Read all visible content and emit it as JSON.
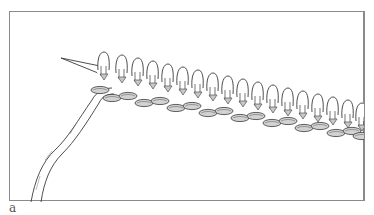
{
  "figure": {
    "label": "a",
    "colors": {
      "line": "#3a3a3a",
      "shade": "#c8c8c8",
      "frame": "#8a8a8a",
      "background": "#ffffff"
    }
  }
}
